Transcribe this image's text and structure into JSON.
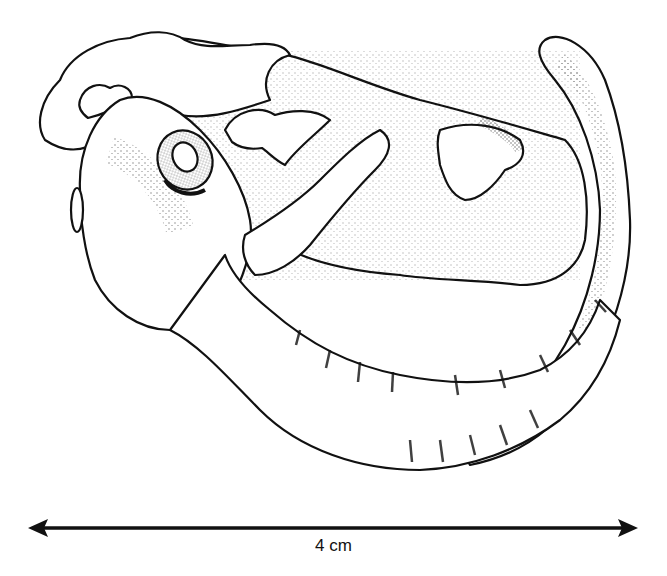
{
  "figure": {
    "style": "stippled-line-drawing",
    "colors": {
      "ink": "#111111",
      "background": "#ffffff"
    }
  },
  "scale_bar": {
    "label": "4 cm",
    "x_start": 28,
    "x_end": 638,
    "y": 528
  }
}
